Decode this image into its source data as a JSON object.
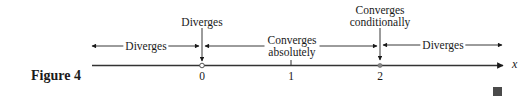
{
  "figure": {
    "caption": "Figure 4",
    "end_mark": "■"
  },
  "axis": {
    "variable": "x",
    "ticks": [
      {
        "value": "0",
        "x": 202,
        "marker": "open-circle"
      },
      {
        "value": "1",
        "x": 291,
        "marker": "tick"
      },
      {
        "value": "2",
        "x": 380,
        "marker": "filled-dot"
      }
    ]
  },
  "regions": [
    {
      "label": "Diverges",
      "range": "x < 0"
    },
    {
      "label_line1": "Converges",
      "label_line2": "absolutely",
      "range": "0 < x < 2"
    },
    {
      "label": "Diverges",
      "range": "x > 2"
    }
  ],
  "endpoints": [
    {
      "label": "Diverges",
      "at": "0"
    },
    {
      "label_line1": "Converges",
      "label_line2": "conditionally",
      "at": "2"
    }
  ],
  "colors": {
    "ink": "#1a1a1a",
    "background": "#ffffff"
  }
}
